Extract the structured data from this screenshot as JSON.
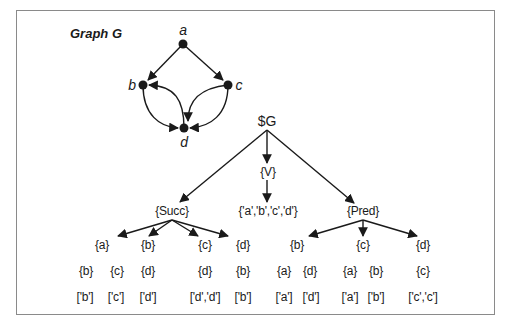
{
  "title": "Graph G",
  "graph": {
    "nodes": [
      {
        "id": "a",
        "label": "a",
        "x": 183,
        "y": 44,
        "lx": 183,
        "ly": 30
      },
      {
        "id": "b",
        "label": "b",
        "x": 143,
        "y": 85,
        "lx": 132,
        "ly": 85
      },
      {
        "id": "c",
        "label": "c",
        "x": 228,
        "y": 85,
        "lx": 239,
        "ly": 85
      },
      {
        "id": "d",
        "label": "d",
        "x": 184,
        "y": 128,
        "lx": 184,
        "ly": 142
      }
    ],
    "edges": [
      {
        "from": "a",
        "to": "b",
        "style": "straight"
      },
      {
        "from": "a",
        "to": "c",
        "style": "straight"
      },
      {
        "from": "b",
        "to": "d",
        "style": "curved"
      },
      {
        "from": "d",
        "to": "b",
        "style": "curved"
      },
      {
        "from": "c",
        "to": "d",
        "style": "curved-outer"
      },
      {
        "from": "c",
        "to": "d",
        "style": "curved-inner"
      }
    ]
  },
  "tree": {
    "root": "$G",
    "v_node": "{V}",
    "v_value": "{'a','b','c','d'}",
    "succ": {
      "label": "{Succ}",
      "children": [
        {
          "key": "{a}",
          "sets": [
            "{b}",
            "{c}"
          ],
          "lists": [
            "['b']",
            "['c']"
          ]
        },
        {
          "key": "{b}",
          "sets": [
            "{d}"
          ],
          "lists": [
            "['d']"
          ]
        },
        {
          "key": "{c}",
          "sets": [
            "{d}"
          ],
          "lists": [
            "['d','d']"
          ]
        },
        {
          "key": "{d}",
          "sets": [
            "{b}"
          ],
          "lists": [
            "['b']"
          ]
        }
      ]
    },
    "pred": {
      "label": "{Pred}",
      "children": [
        {
          "key": "{b}",
          "sets": [
            "{a}",
            "{d}"
          ],
          "lists": [
            "['a']",
            "['d']"
          ]
        },
        {
          "key": "{c}",
          "sets": [
            "{a}",
            "{b}"
          ],
          "lists": [
            "['a']",
            "['b']"
          ]
        },
        {
          "key": "{d}",
          "sets": [
            "{c}"
          ],
          "lists": [
            "['c','c']"
          ]
        }
      ]
    }
  },
  "colors": {
    "stroke": "#1a1a1a",
    "frame": "#8a8a8a",
    "background": "#ffffff"
  }
}
